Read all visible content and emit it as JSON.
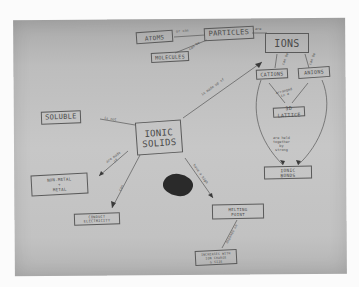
{
  "diagram": {
    "type": "hand-drawn concept map",
    "central_node": "IONIC SOLIDS",
    "nodes": {
      "atoms": "ATOMS",
      "particles": "PARTICLES",
      "molecules": "MOLECULES",
      "ions": "IONS",
      "cations": "CATIONS",
      "anions": "ANIONS",
      "lattice": "3D LATTICE",
      "ionic_bonds": "IONIC\nBONDS",
      "soluble": "SOLUBLE",
      "ionic_solids": "IONIC\nSOLIDS",
      "nonmetal_metal": "NON-METAL\n+\nMETAL",
      "conduct_electricity": "CONDUCT\nELECTRICITY",
      "melting_point": "MELTING\nPOINT",
      "high_melting": "INCREASES WITH\nION CHARGE\n& SIZE"
    },
    "link_labels": {
      "atoms_particles": "or can",
      "particles_ions": "are",
      "molecules_particles": "can be",
      "ionic_ions": "is made up of",
      "ions_cations": "can be",
      "ions_anions": "can be",
      "lattice_label": "arranged\nin a",
      "bonds_label": "are held\ntogether\nby\nstrong",
      "soluble_link": "is not",
      "nonmetal_link": "are made\nof",
      "conduct_link": "can",
      "melting_link": "have a high",
      "melting_down": "depends on"
    },
    "colors": {
      "paper": "#c2c2c2",
      "ink": "#4a4a4a",
      "background": "#fbfbfb",
      "blob": "#2a2a2a"
    }
  }
}
